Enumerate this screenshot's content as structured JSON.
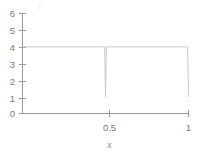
{
  "chart_data": {
    "type": "line",
    "title": "",
    "subtitle": "",
    "xlabel": "x",
    "ylabel": "y",
    "xlim": [
      0,
      1
    ],
    "ylim": [
      0,
      6
    ],
    "grid": false,
    "legend": null,
    "x_ticks": [
      0.5,
      1
    ],
    "x_tick_labels": [
      "0.5",
      "1"
    ],
    "y_ticks": [
      0,
      1,
      2,
      3,
      4,
      5,
      6
    ],
    "y_tick_labels": [
      "0",
      "1",
      "2",
      "3",
      "4",
      "5",
      "6"
    ],
    "series": [
      {
        "name": "u(x)",
        "color": "#c9c9c9",
        "x": [
          0.0,
          0.47,
          0.495,
          0.5,
          0.505,
          0.53,
          0.97,
          0.995,
          1.0
        ],
        "y": [
          4.0,
          4.0,
          4.0,
          1.0,
          4.0,
          4.0,
          4.0,
          4.0,
          1.0
        ]
      }
    ],
    "annotations": [
      {
        "text": "Plateau at value 4 across the domain with narrow downward spikes to 1 at x = 0.5 and x = 1",
        "x": 0.5,
        "y": 1
      }
    ]
  },
  "axes": {
    "x_axis_name": "x-axis",
    "y_axis_name": "y-axis",
    "x_title": "x",
    "y_title": "y"
  },
  "figure": {
    "background_color": "#ffffff",
    "line_color": "#c9c9c9",
    "axis_color": "#9a9a9a",
    "text_color": "#7a7a7a"
  }
}
